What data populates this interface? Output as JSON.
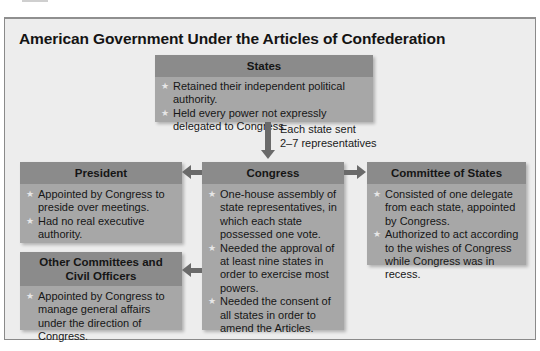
{
  "title": "American Government Under the Articles of Confederation",
  "arrow_label": {
    "line1": "Each state sent",
    "line2": "2–7 representatives"
  },
  "boxes": {
    "states": {
      "header": "States",
      "items": [
        "Retained their independent political authority.",
        "Held every power not expressly delegated to Congress."
      ]
    },
    "president": {
      "header": "President",
      "items": [
        "Appointed by Congress to preside over meetings.",
        "Had no real executive authority."
      ]
    },
    "congress": {
      "header": "Congress",
      "items": [
        "One-house assembly of state representatives, in which each state possessed one vote.",
        "Needed the approval of at least nine states in order to exercise most powers.",
        "Needed the consent of all states in order to amend the Articles."
      ]
    },
    "committee_of_states": {
      "header": "Committee of States",
      "items": [
        "Consisted of one delegate from each state, appointed by Congress.",
        "Authorized to act according to the wishes of Congress while Congress was in recess."
      ]
    },
    "other_committees": {
      "header": "Other Committees and Civil Officers",
      "items": [
        "Appointed by Congress to manage general affairs under the direction of Congress."
      ]
    }
  },
  "icons": {
    "bullet": "★"
  },
  "colors": {
    "panel_bg": "#ededed",
    "box_header": "#8b8b8b",
    "box_body": "#a7a7a7",
    "arrow": "#6a6a6a"
  }
}
